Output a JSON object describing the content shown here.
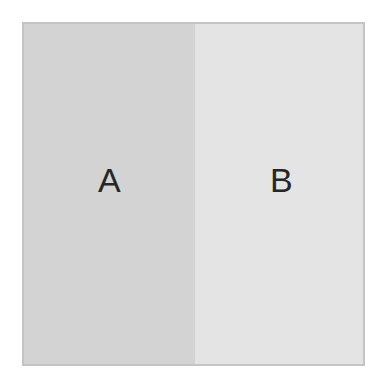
{
  "diagram": {
    "panels": [
      {
        "label": "A",
        "color": "#d3d3d3"
      },
      {
        "label": "B",
        "color": "#e4e4e4"
      }
    ],
    "border_color": "#c4c4c4"
  }
}
